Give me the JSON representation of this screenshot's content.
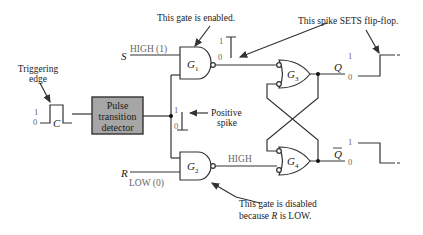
{
  "diagram": {
    "inputs": {
      "s_label": "S",
      "s_state": "HIGH (1)",
      "r_label": "R",
      "r_state": "LOW (0)",
      "c_label": "C"
    },
    "clock": {
      "annotation_line1": "Triggering",
      "annotation_line2": "edge",
      "level_high": "1",
      "level_low": "0"
    },
    "detector": {
      "line1": "Pulse",
      "line2": "transition",
      "line3": "detector",
      "fill_color": "#a6a6a6"
    },
    "spike": {
      "level_high": "1",
      "level_low": "0",
      "annotation_line1": "Positive",
      "annotation_line2": "spike"
    },
    "gates": {
      "g1": "G",
      "g1_sub": "1",
      "g2": "G",
      "g2_sub": "2",
      "g3": "G",
      "g3_sub": "3",
      "g4": "G",
      "g4_sub": "4"
    },
    "g1_output": {
      "level_high": "1",
      "level_low": "0"
    },
    "g2_output_state": "HIGH",
    "outputs": {
      "q_label": "Q",
      "q_level_high": "1",
      "q_level_low": "0",
      "qbar_label": "Q",
      "qbar_level_high": "1",
      "qbar_level_low": "0"
    },
    "annotations": {
      "g1_enabled": "This gate is enabled.",
      "spike_sets": "This spike SETS flip-flop.",
      "g2_disabled_line1": "This gate is disabled",
      "g2_disabled_line2_pre": "because ",
      "g2_disabled_line2_var": "R",
      "g2_disabled_line2_post": " is LOW."
    }
  }
}
